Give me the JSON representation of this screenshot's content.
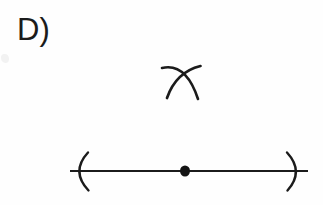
{
  "figure": {
    "type": "geometric-construction-diagram",
    "title_label": "D)",
    "background_color": "#fefefe",
    "ink_color": "#1b1b1b",
    "canvas": {
      "width": 323,
      "height": 205
    },
    "elements": [
      {
        "name": "answer-choice-label",
        "kind": "text",
        "text": "D)",
        "x": 17,
        "y": 13,
        "font_size_px": 31,
        "color": "#1b1b1b"
      },
      {
        "name": "compass-arc-pair",
        "kind": "crossed-arcs",
        "description": "Two intersecting compass arcs forming an X above the line",
        "intersection": {
          "x": 181,
          "y": 75
        },
        "bbox": {
          "x": 160,
          "y": 64,
          "width": 44,
          "height": 36
        },
        "arcs": [
          {
            "name": "arc-left-to-lower-right",
            "start": {
              "x": 162,
              "y": 68
            },
            "control": {
              "x": 186,
              "y": 63
            },
            "end": {
              "x": 198,
              "y": 99
            },
            "stroke_width": 2.6
          },
          {
            "name": "arc-right-to-lower-left",
            "start": {
              "x": 200,
              "y": 66
            },
            "control": {
              "x": 177,
              "y": 72
            },
            "end": {
              "x": 167,
              "y": 98
            },
            "stroke_width": 2.6
          }
        ]
      },
      {
        "name": "horizontal-line",
        "kind": "line",
        "x1": 70,
        "y1": 171,
        "x2": 308,
        "y2": 171,
        "stroke_width": 2.0
      },
      {
        "name": "left-arc-marker",
        "kind": "arc",
        "glyph": "(",
        "start": {
          "x": 87,
          "y": 152
        },
        "control": {
          "x": 70,
          "y": 172
        },
        "end": {
          "x": 88,
          "y": 191
        },
        "stroke_width": 2.4
      },
      {
        "name": "right-arc-marker",
        "kind": "arc",
        "glyph": ")",
        "start": {
          "x": 287,
          "y": 152
        },
        "control": {
          "x": 305,
          "y": 172
        },
        "end": {
          "x": 288,
          "y": 191
        },
        "stroke_width": 2.4
      },
      {
        "name": "midpoint-dot",
        "kind": "filled-circle",
        "cx": 185,
        "cy": 171,
        "rx": 5.0,
        "ry": 5.6,
        "fill": "#141414"
      },
      {
        "name": "scan-smudge",
        "kind": "artifact",
        "x": 1,
        "y": 54,
        "width": 8,
        "height": 9,
        "color": "#f2f2f2"
      }
    ]
  }
}
